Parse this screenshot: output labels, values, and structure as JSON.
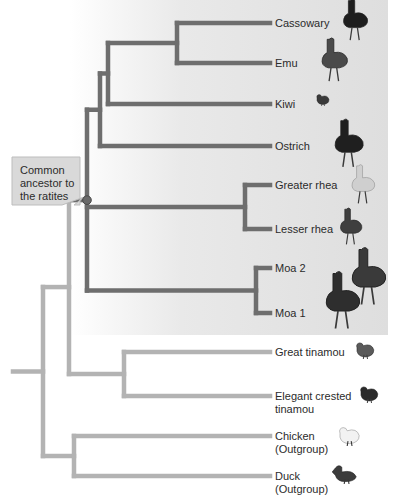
{
  "figure": {
    "callout": {
      "lines": [
        "Common",
        "ancestor to",
        "the ratites"
      ]
    },
    "colors": {
      "ratite_branch": "#6e6e6e",
      "other_branch": "#b3b3b3",
      "ancestor_node": "#6a6a6a",
      "callout_fill": "#d9d9d9",
      "callout_border": "#bdbdbd",
      "ratite_panel": "#e0e0e0"
    },
    "taxa": [
      {
        "id": "cassowary",
        "label": [
          "Cassowary"
        ],
        "group": "ratite",
        "icon": "cassowary-icon",
        "icon_color": "#1e1e1e"
      },
      {
        "id": "emu",
        "label": [
          "Emu"
        ],
        "group": "ratite",
        "icon": "emu-icon",
        "icon_color": "#4a4a4a"
      },
      {
        "id": "kiwi",
        "label": [
          "Kiwi"
        ],
        "group": "ratite",
        "icon": "kiwi-icon",
        "icon_color": "#3a3a3a"
      },
      {
        "id": "ostrich",
        "label": [
          "Ostrich"
        ],
        "group": "ratite",
        "icon": "ostrich-icon",
        "icon_color": "#1f1f1f"
      },
      {
        "id": "greater-rhea",
        "label": [
          "Greater rhea"
        ],
        "group": "ratite",
        "icon": "greater-rhea-icon",
        "icon_color": "#cfcfcf"
      },
      {
        "id": "lesser-rhea",
        "label": [
          "Lesser rhea"
        ],
        "group": "ratite",
        "icon": "lesser-rhea-icon",
        "icon_color": "#3f3f3f"
      },
      {
        "id": "moa-2",
        "label": [
          "Moa 2"
        ],
        "group": "ratite",
        "icon": "moa-icon",
        "icon_color": "#3a3a3a"
      },
      {
        "id": "moa-1",
        "label": [
          "Moa 1"
        ],
        "group": "ratite",
        "icon": "moa-icon",
        "icon_color": "#2e2e2e"
      },
      {
        "id": "great-tinamou",
        "label": [
          "Great tinamou"
        ],
        "group": "other",
        "icon": "great-tinamou-icon",
        "icon_color": "#5a5a5a"
      },
      {
        "id": "elegant-crested-tinamou",
        "label": [
          "Elegant crested",
          "tinamou"
        ],
        "group": "other",
        "icon": "crested-tinamou-icon",
        "icon_color": "#2a2a2a"
      },
      {
        "id": "chicken",
        "label": [
          "Chicken",
          "(Outgroup)"
        ],
        "group": "other",
        "icon": "chicken-icon",
        "icon_color": "#f2f2f2"
      },
      {
        "id": "duck",
        "label": [
          "Duck",
          "(Outgroup)"
        ],
        "group": "other",
        "icon": "duck-icon",
        "icon_color": "#3c3c3c"
      }
    ],
    "tree": {
      "id": "root",
      "group": "other",
      "children": [
        {
          "id": "palaeognathae",
          "group": "other",
          "children": [
            {
              "id": "ratites",
              "group": "ratite",
              "marked": true,
              "children": [
                {
                  "id": "r1",
                  "group": "ratite",
                  "children": [
                    {
                      "id": "r2",
                      "group": "ratite",
                      "children": [
                        {
                          "id": "r3",
                          "group": "ratite",
                          "children": [
                            {
                              "taxon": "cassowary"
                            },
                            {
                              "taxon": "emu"
                            }
                          ]
                        },
                        {
                          "taxon": "kiwi"
                        }
                      ]
                    },
                    {
                      "taxon": "ostrich"
                    }
                  ]
                },
                {
                  "id": "rheas",
                  "group": "ratite",
                  "children": [
                    {
                      "taxon": "greater-rhea"
                    },
                    {
                      "taxon": "lesser-rhea"
                    }
                  ]
                },
                {
                  "id": "moas",
                  "group": "ratite",
                  "children": [
                    {
                      "taxon": "moa-2"
                    },
                    {
                      "taxon": "moa-1"
                    }
                  ]
                }
              ]
            },
            {
              "id": "tinamous",
              "group": "other",
              "children": [
                {
                  "taxon": "great-tinamou"
                },
                {
                  "taxon": "elegant-crested-tinamou"
                }
              ]
            }
          ]
        },
        {
          "id": "galloanserae",
          "group": "other",
          "children": [
            {
              "taxon": "chicken"
            },
            {
              "taxon": "duck"
            }
          ]
        }
      ]
    }
  }
}
